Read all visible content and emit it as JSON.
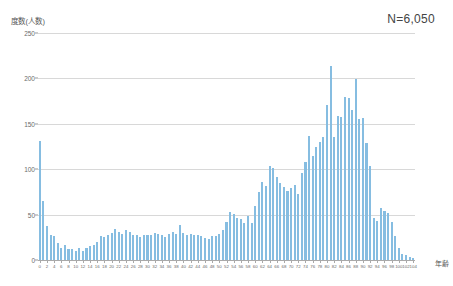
{
  "chart_data": {
    "type": "bar",
    "title": "",
    "subtitle": "",
    "xlabel": "年齢",
    "ylabel": "度数(人数)",
    "annotation": "N=6,050",
    "grid": true,
    "legend": "none",
    "xlim": [
      0,
      104
    ],
    "ylim": [
      0,
      250
    ],
    "yticks": [
      0,
      50,
      100,
      150,
      200,
      250
    ],
    "ytick_labels": [
      "0",
      "50",
      "100",
      "150",
      "200",
      "250"
    ],
    "xtick_step": 2,
    "xtick_labels": [
      "0",
      "2",
      "4",
      "6",
      "8",
      "10",
      "12",
      "14",
      "16",
      "18",
      "20",
      "22",
      "24",
      "26",
      "28",
      "30",
      "32",
      "34",
      "36",
      "38",
      "40",
      "42",
      "44",
      "46",
      "48",
      "50",
      "52",
      "54",
      "56",
      "58",
      "60",
      "62",
      "64",
      "66",
      "68",
      "70",
      "72",
      "74",
      "76",
      "78",
      "80",
      "82",
      "84",
      "86",
      "88",
      "90",
      "92",
      "94",
      "96",
      "98",
      "100",
      "102",
      "104"
    ],
    "bar_color": "#86bde1",
    "grid_color": "#d8d8d8",
    "axis_color": "#a9a9a9",
    "categories": [
      0,
      1,
      2,
      3,
      4,
      5,
      6,
      7,
      8,
      9,
      10,
      11,
      12,
      13,
      14,
      15,
      16,
      17,
      18,
      19,
      20,
      21,
      22,
      23,
      24,
      25,
      26,
      27,
      28,
      29,
      30,
      31,
      32,
      33,
      34,
      35,
      36,
      37,
      38,
      39,
      40,
      41,
      42,
      43,
      44,
      45,
      46,
      47,
      48,
      49,
      50,
      51,
      52,
      53,
      54,
      55,
      56,
      57,
      58,
      59,
      60,
      61,
      62,
      63,
      64,
      65,
      66,
      67,
      68,
      69,
      70,
      71,
      72,
      73,
      74,
      75,
      76,
      77,
      78,
      79,
      80,
      81,
      82,
      83,
      84,
      85,
      86,
      87,
      88,
      89,
      90,
      91,
      92,
      93,
      94,
      95,
      96,
      97,
      98,
      99,
      100,
      101,
      102,
      103,
      104
    ],
    "values": [
      131,
      65,
      38,
      27,
      26,
      19,
      13,
      16,
      12,
      12,
      10,
      13,
      10,
      13,
      15,
      17,
      20,
      26,
      25,
      27,
      30,
      34,
      31,
      29,
      33,
      31,
      28,
      27,
      25,
      28,
      28,
      28,
      30,
      29,
      28,
      25,
      29,
      31,
      29,
      39,
      30,
      27,
      29,
      28,
      28,
      26,
      24,
      23,
      26,
      26,
      29,
      33,
      42,
      53,
      51,
      46,
      45,
      41,
      48,
      41,
      60,
      75,
      86,
      82,
      103,
      101,
      91,
      85,
      80,
      76,
      79,
      83,
      73,
      96,
      108,
      137,
      115,
      125,
      130,
      135,
      171,
      214,
      136,
      159,
      157,
      179,
      178,
      165,
      199,
      155,
      156,
      129,
      104,
      46,
      43,
      57,
      54,
      52,
      42,
      26,
      13,
      7,
      6,
      3,
      2
    ],
    "series_name": "度数"
  }
}
